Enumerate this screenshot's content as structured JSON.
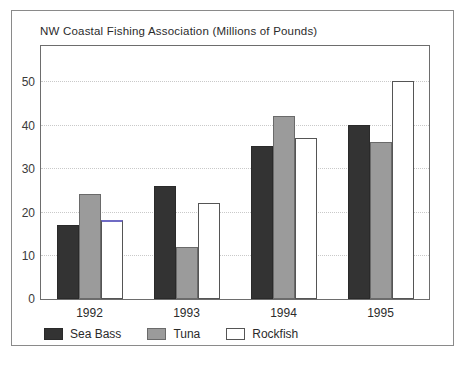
{
  "chart_data": {
    "type": "bar",
    "title": "NW Coastal Fishing Association (Millions of Pounds)",
    "xlabel": "",
    "ylabel": "",
    "categories": [
      "1992",
      "1993",
      "1994",
      "1995"
    ],
    "series": [
      {
        "name": "Sea Bass",
        "color": "#333333",
        "values": [
          17,
          26,
          35,
          40
        ]
      },
      {
        "name": "Tuna",
        "color": "#9b9b9b",
        "values": [
          24,
          12,
          42,
          36
        ]
      },
      {
        "name": "Rockfish",
        "color": "#ffffff",
        "values": [
          18,
          22,
          37,
          50
        ]
      }
    ],
    "ylim": [
      0,
      58
    ],
    "yticks": [
      0,
      10,
      20,
      30,
      40,
      50
    ],
    "grid": true,
    "legend_position": "bottom-left",
    "annotations": [
      {
        "kind": "highlighted-bar-top",
        "series": "Rockfish",
        "category": "1992",
        "color": "#6f6bc4"
      }
    ]
  }
}
